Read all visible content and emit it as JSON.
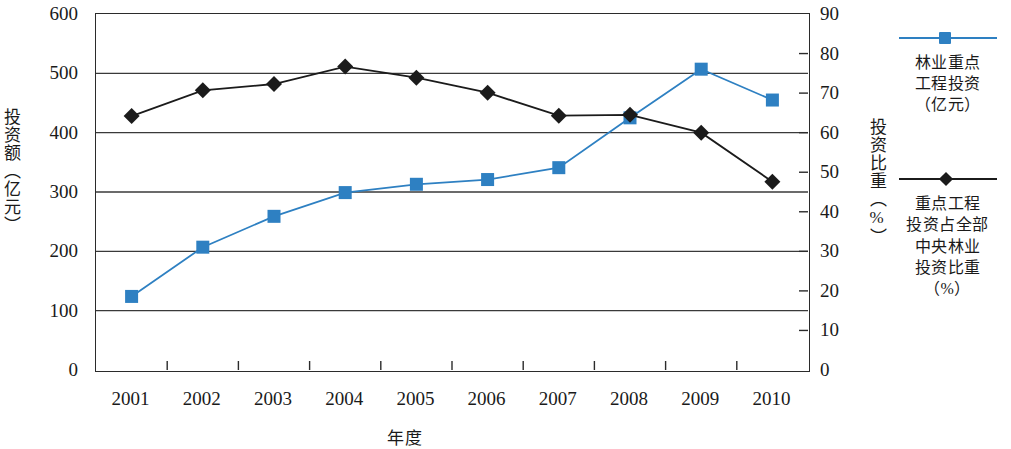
{
  "chart_data": {
    "type": "line",
    "title": "",
    "xlabel": "年度",
    "ylabel": "投资额（亿元）",
    "y2label": "投资比重（%）",
    "categories": [
      "2001",
      "2002",
      "2003",
      "2004",
      "2005",
      "2006",
      "2007",
      "2008",
      "2009",
      "2010"
    ],
    "ylim": [
      0,
      600
    ],
    "yticks": [
      "0",
      "100",
      "200",
      "300",
      "400",
      "500",
      "600"
    ],
    "y2lim": [
      0,
      90
    ],
    "y2ticks": [
      "0",
      "10",
      "20",
      "30",
      "40",
      "50",
      "60",
      "70",
      "80",
      "90"
    ],
    "grid": true,
    "legend_position": "right",
    "series": [
      {
        "name": "林业重点工程投资（亿元）",
        "axis": "left",
        "marker": "square",
        "color": "#2e80c2",
        "values": [
          124,
          207,
          259,
          299,
          313,
          321,
          341,
          425,
          507,
          455
        ]
      },
      {
        "name": "重点工程投资占全部中央林业投资比重（%）",
        "axis": "right",
        "marker": "diamond",
        "color": "#1b1b1b",
        "values": [
          64.2,
          70.7,
          72.3,
          76.7,
          73.9,
          70.1,
          64.3,
          64.5,
          60.0,
          47.6
        ]
      }
    ]
  },
  "legend": {
    "entries": [
      {
        "label": "林业重点工程投资（亿元）",
        "lines": [
          "林业重点",
          "工程投资",
          "（亿元）"
        ]
      },
      {
        "label": "重点工程投资占全部中央林业投资比重（%）",
        "lines": [
          "重点工程",
          "投资占全部",
          "中央林业",
          "投资比重",
          "（%）"
        ]
      }
    ]
  },
  "colors": {
    "series1": "#2e80c2",
    "series2": "#1b1b1b",
    "grid": "#3a3a3a",
    "axis": "#2b2b2b",
    "background": "#ffffff"
  }
}
